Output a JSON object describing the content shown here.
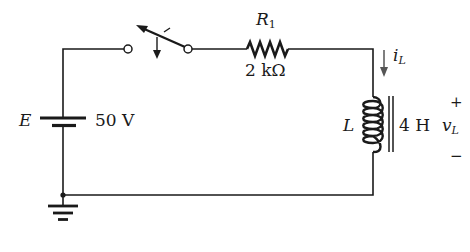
{
  "diagram": {
    "type": "RL circuit schematic",
    "source": {
      "symbol": "E",
      "value": "50 V"
    },
    "switch": {
      "state": "open"
    },
    "resistor": {
      "symbol": "R",
      "subscript": "1",
      "value": "2 kΩ"
    },
    "inductor": {
      "symbol": "L",
      "value": "4 H"
    },
    "current": {
      "symbol": "i",
      "subscript": "L"
    },
    "voltage": {
      "symbol": "v",
      "subscript": "L",
      "plus": "+",
      "minus": "−"
    },
    "ground": "ground",
    "colors": {
      "wire": "#1a1a1a",
      "annotation_arrow": "#555555",
      "background": "#ffffff"
    }
  }
}
